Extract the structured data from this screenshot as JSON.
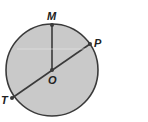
{
  "diagram": {
    "type": "circle-geometry",
    "circle": {
      "cx": 52,
      "cy": 70,
      "r": 46,
      "fill": "#c9c9c9",
      "stroke": "#3a3a3a"
    },
    "points": {
      "M": {
        "label": "M",
        "x": 52,
        "y": 25
      },
      "P": {
        "label": "P",
        "x": 90,
        "y": 44
      },
      "O": {
        "label": "O",
        "x": 52,
        "y": 70
      },
      "T": {
        "label": "T",
        "x": 12,
        "y": 98
      }
    },
    "segments": [
      {
        "name": "OM",
        "from": "O",
        "to": "M"
      },
      {
        "name": "TP",
        "from": "T",
        "to": "P"
      }
    ]
  }
}
